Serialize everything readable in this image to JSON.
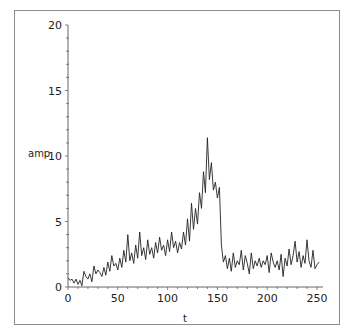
{
  "chart_data": {
    "type": "line",
    "title": "",
    "xlabel": "t",
    "ylabel": "amp",
    "xlim": [
      0,
      256
    ],
    "ylim": [
      0,
      20
    ],
    "grid": false,
    "legend": null,
    "x_ticks": [
      0,
      50,
      100,
      150,
      200,
      250
    ],
    "y_ticks": [
      0,
      5,
      10,
      15,
      20
    ],
    "series": [
      {
        "name": "amp",
        "color": "#222222",
        "x": [
          0,
          2,
          4,
          6,
          8,
          10,
          12,
          14,
          16,
          18,
          20,
          22,
          24,
          26,
          28,
          30,
          32,
          34,
          36,
          38,
          40,
          42,
          44,
          46,
          48,
          50,
          52,
          54,
          56,
          58,
          60,
          62,
          64,
          66,
          68,
          70,
          72,
          74,
          76,
          78,
          80,
          82,
          84,
          86,
          88,
          90,
          92,
          94,
          96,
          98,
          100,
          102,
          104,
          106,
          108,
          110,
          112,
          114,
          116,
          118,
          120,
          122,
          124,
          126,
          128,
          130,
          132,
          134,
          136,
          138,
          140,
          142,
          144,
          146,
          148,
          150,
          152,
          154,
          156,
          158,
          160,
          162,
          164,
          166,
          168,
          170,
          172,
          174,
          176,
          178,
          180,
          182,
          184,
          186,
          188,
          190,
          192,
          194,
          196,
          198,
          200,
          202,
          204,
          206,
          208,
          210,
          212,
          214,
          216,
          218,
          220,
          222,
          224,
          226,
          228,
          230,
          232,
          234,
          236,
          238,
          240,
          242,
          244,
          246,
          248,
          250,
          252
        ],
        "values": [
          0.7,
          0.5,
          0.6,
          0.3,
          0.6,
          0.2,
          0.5,
          0.1,
          1.2,
          0.8,
          0.6,
          1.0,
          0.4,
          1.6,
          1.0,
          1.3,
          1.1,
          0.8,
          1.5,
          0.9,
          1.9,
          1.2,
          2.4,
          1.6,
          1.8,
          1.3,
          2.2,
          1.5,
          2.8,
          1.9,
          4.0,
          2.0,
          2.6,
          1.8,
          3.2,
          2.2,
          4.2,
          2.4,
          3.0,
          2.1,
          3.6,
          2.5,
          3.0,
          2.2,
          3.4,
          2.6,
          3.8,
          2.8,
          3.2,
          2.4,
          3.6,
          2.7,
          4.2,
          3.0,
          3.5,
          2.6,
          3.4,
          2.9,
          4.2,
          3.2,
          5.2,
          3.5,
          6.4,
          4.4,
          6.0,
          4.8,
          7.2,
          6.0,
          8.8,
          7.2,
          11.4,
          8.2,
          9.5,
          7.4,
          8.0,
          6.8,
          7.6,
          3.2,
          1.9,
          2.4,
          1.4,
          2.2,
          1.2,
          2.6,
          1.5,
          2.0,
          1.7,
          2.8,
          1.3,
          2.4,
          1.8,
          1.0,
          2.6,
          1.4,
          2.0,
          1.6,
          2.2,
          1.5,
          2.0,
          1.7,
          2.4,
          1.1,
          2.6,
          1.9,
          1.5,
          2.0,
          1.3,
          2.5,
          0.8,
          2.2,
          1.6,
          2.9,
          1.7,
          2.4,
          3.5,
          1.9,
          2.7,
          1.5,
          2.4,
          1.8,
          3.6,
          2.0,
          1.5,
          2.8,
          1.4,
          1.7,
          1.9
        ]
      }
    ]
  },
  "axes": {
    "x_label": "t",
    "y_label": "amp",
    "x_tick_labels": [
      "0",
      "50",
      "100",
      "150",
      "200",
      "250"
    ],
    "y_tick_labels": [
      "0",
      "5",
      "10",
      "15",
      "20"
    ]
  }
}
